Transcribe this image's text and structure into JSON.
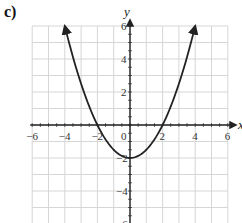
{
  "panel_label": "c)",
  "chart_data": {
    "type": "line",
    "title": "",
    "xlabel": "x",
    "ylabel": "y",
    "xlim": [
      -6,
      6
    ],
    "ylim": [
      -6,
      6
    ],
    "grid": true,
    "x_ticks": [
      -6,
      -4,
      -2,
      0,
      2,
      4,
      6
    ],
    "y_ticks": [
      -6,
      -4,
      -2,
      2,
      4,
      6
    ],
    "x_tick_labels": [
      "−6",
      "−4",
      "−2",
      "0",
      "2",
      "4",
      "6"
    ],
    "y_tick_labels": [
      "−6",
      "−4",
      "−2",
      "2",
      "4",
      "6"
    ],
    "series": [
      {
        "name": "parabola",
        "equation": "y = x^2/2 - 2",
        "x": [
          -4,
          -3,
          -2,
          -1,
          0,
          1,
          2,
          3,
          4
        ],
        "y": [
          6,
          2.5,
          0,
          -1.5,
          -2,
          -1.5,
          0,
          2.5,
          6
        ],
        "color": "#222222",
        "arrows_at_ends": true
      }
    ],
    "key_points": {
      "vertex": [
        0,
        -2
      ],
      "x_intercepts": [
        -2,
        2
      ],
      "y_intercept": -2
    }
  }
}
